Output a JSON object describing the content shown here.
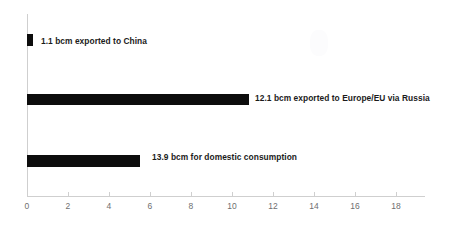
{
  "chart_data": {
    "type": "bar",
    "orientation": "horizontal",
    "title": "",
    "subtitle": "",
    "xlabel": "",
    "ylabel": "",
    "xlim": [
      0,
      19.2
    ],
    "ylim": null,
    "grid": false,
    "legend": null,
    "bar_color": "#0d0d0d",
    "axis_color": "#cfcfcf",
    "background": "#ffffff",
    "xticks": [
      0,
      2,
      4,
      6,
      8,
      10,
      12,
      14,
      16,
      18
    ],
    "xtick_labels": [
      "0",
      "2",
      "4",
      "6",
      "8",
      "10",
      "12",
      "14",
      "16",
      "18"
    ],
    "categories": [
      "1.1 bcm exported to China",
      "12.1 bcm exported to Europe/EU via Russia",
      "13.9 bcm for domestic consumption"
    ],
    "values": [
      1.1,
      12.1,
      13.9
    ],
    "bar_lengths_plotted": [
      0.3,
      10.85,
      5.5
    ],
    "annotations": [
      {
        "text": "1.1 bcm exported to China",
        "value": 1.1,
        "bar_length": 0.3
      },
      {
        "text": "12.1 bcm exported to Europe/EU via Russia",
        "value": 12.1,
        "bar_length": 10.85
      },
      {
        "text": "13.9 bcm for domestic consumption",
        "value": 13.9,
        "bar_length": 5.5
      }
    ]
  },
  "bars": [
    {
      "label": "1.1 bcm exported to China",
      "value": "1.1",
      "bar_length": 0.3,
      "bar_top": 34,
      "bar_height": 12,
      "label_left": 41,
      "label_top": 36
    },
    {
      "label": "12.1 bcm exported to Europe/EU via Russia",
      "value": "12.1",
      "bar_length": 10.85,
      "bar_top": 94,
      "bar_height": 11,
      "label_left": 255,
      "label_top": 93
    },
    {
      "label": "13.9 bcm for domestic consumption",
      "value": "13.9",
      "bar_length": 5.5,
      "bar_top": 155,
      "bar_height": 12,
      "label_left": 152,
      "label_top": 152
    }
  ]
}
